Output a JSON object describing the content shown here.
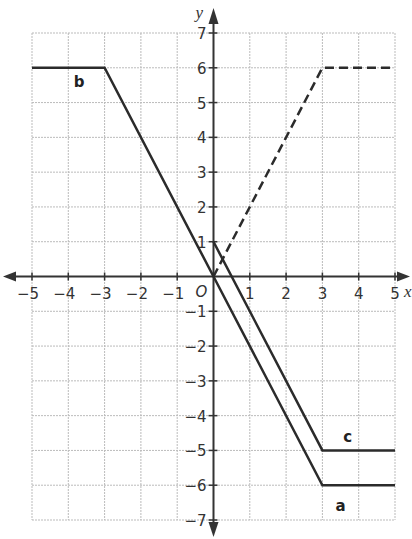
{
  "chart_data": {
    "type": "line",
    "title": "",
    "xlabel": "x",
    "ylabel": "y",
    "origin_label": "O",
    "xlim": [
      -5,
      5
    ],
    "ylim": [
      -7,
      7
    ],
    "x_ticks": [
      -5,
      -4,
      -3,
      -2,
      -1,
      1,
      2,
      3,
      4,
      5
    ],
    "y_ticks": [
      -7,
      -6,
      -5,
      -4,
      -3,
      -2,
      -1,
      1,
      2,
      3,
      4,
      5,
      6,
      7
    ],
    "grid": true,
    "series": [
      {
        "name": "a",
        "style": "solid",
        "points": [
          [
            0,
            0
          ],
          [
            3,
            -6
          ],
          [
            5,
            -6
          ]
        ],
        "label_pos": [
          3.5,
          -6.6
        ]
      },
      {
        "name": "b",
        "style": "solid",
        "points": [
          [
            -5,
            6
          ],
          [
            -3,
            6
          ],
          [
            0,
            0
          ]
        ],
        "label_pos": [
          -3.7,
          5.6
        ]
      },
      {
        "name": "c",
        "style": "solid",
        "points": [
          [
            0,
            1
          ],
          [
            3,
            -5
          ],
          [
            5,
            -5
          ]
        ],
        "label_pos": [
          3.7,
          -4.6
        ]
      },
      {
        "name": "dashed",
        "style": "dashed",
        "points": [
          [
            0,
            0
          ],
          [
            3,
            6
          ],
          [
            5,
            6
          ]
        ],
        "label_pos": null
      }
    ]
  },
  "colors": {
    "grid": "#bbbbbb",
    "axis": "#333333",
    "line": "#2b2b2b"
  }
}
